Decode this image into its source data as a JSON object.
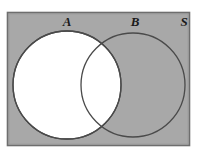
{
  "figure": {
    "kind": "venn-diagram",
    "labels": {
      "set_a": "A",
      "set_b": "B",
      "universal_set": "S"
    },
    "colors": {
      "page_background": "#ffffff",
      "universe_fill": "#a8a8a8",
      "universe_stroke": "#6e6e6e",
      "circle_a_fill": "#ffffff",
      "circle_b_fill": "none",
      "circle_stroke": "#4a4a4a",
      "label_color": "#1a1a1a"
    },
    "geometry": {
      "canvas": {
        "width": 206,
        "height": 161
      },
      "universe_rect": {
        "x": 7,
        "y": 12,
        "width": 183,
        "height": 134
      },
      "circle_a": {
        "cx": 67,
        "cy": 85,
        "r": 54
      },
      "circle_b": {
        "cx": 133,
        "cy": 85,
        "r": 52
      },
      "label_positions": {
        "set_a": {
          "x": 67,
          "y": 26
        },
        "set_b": {
          "x": 135,
          "y": 26
        },
        "set_s": {
          "x": 184,
          "y": 26
        }
      }
    }
  }
}
